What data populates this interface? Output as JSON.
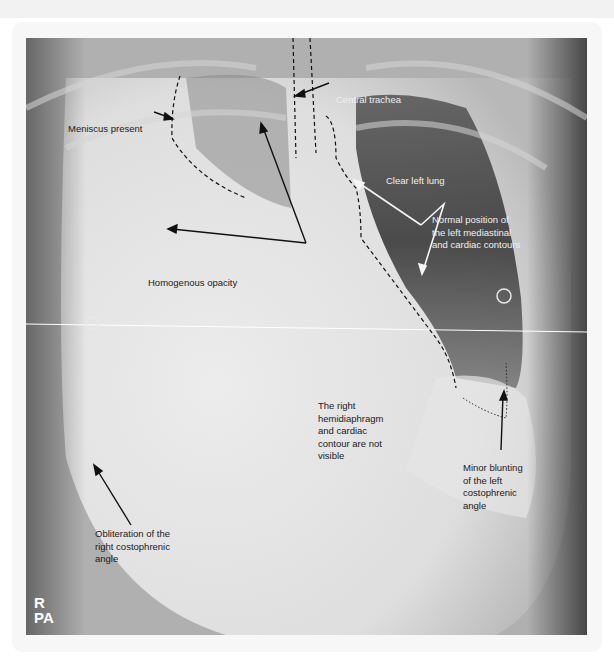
{
  "image": {
    "description": "Annotated PA chest radiograph",
    "view_markers": {
      "side": "R",
      "projection": "PA"
    }
  },
  "annotations": [
    {
      "id": "meniscus",
      "text": "Meniscus present",
      "color": "dark"
    },
    {
      "id": "trachea",
      "text": "Central trachea",
      "color": "light"
    },
    {
      "id": "left-lung",
      "text": "Clear left lung",
      "color": "light"
    },
    {
      "id": "mediastinal",
      "text": "Normal position of\nthe left mediastinal\nand cardiac contours",
      "color": "light"
    },
    {
      "id": "opacity",
      "text": "Homogenous opacity",
      "color": "dark"
    },
    {
      "id": "hemidiaphragm",
      "text": "The right\nhemidiaphragm\nand cardiac\ncontour are not\nvisible",
      "color": "dark"
    },
    {
      "id": "left-cp",
      "text": "Minor blunting\nof the left\ncostophrenic\nangle",
      "color": "dark"
    },
    {
      "id": "right-cp",
      "text": "Obliteration of the\nright costophrenic\nangle",
      "color": "dark"
    }
  ]
}
